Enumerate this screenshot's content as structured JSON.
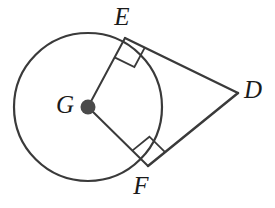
{
  "figure": {
    "type": "geometry-diagram",
    "background_color": "#ffffff",
    "stroke_color": "#3a3a3a",
    "label_color": "#1a1a1a",
    "circle": {
      "center_label": "G",
      "center_x": 88,
      "center_y": 107,
      "radius": 74,
      "stroke_width": 2.2
    },
    "points": [
      {
        "label": "E",
        "x": 125,
        "y": 38,
        "role": "tangent-point",
        "label_x": 122,
        "label_y": 19
      },
      {
        "label": "G",
        "x": 88,
        "y": 107,
        "role": "center",
        "label_x": 65,
        "label_y": 107
      },
      {
        "label": "D",
        "x": 238,
        "y": 93,
        "role": "external-point",
        "label_x": 253,
        "label_y": 92
      },
      {
        "label": "F",
        "x": 148,
        "y": 166,
        "role": "tangent-point",
        "label_x": 141,
        "label_y": 188
      }
    ],
    "segments": [
      {
        "name": "radius-GE",
        "from": "G",
        "to": "E",
        "x1": 88,
        "y1": 107,
        "x2": 125,
        "y2": 38,
        "stroke_width": 2.0
      },
      {
        "name": "radius-GF",
        "from": "G",
        "to": "F",
        "x1": 88,
        "y1": 107,
        "x2": 148,
        "y2": 166,
        "stroke_width": 2.0
      },
      {
        "name": "tangent-ED",
        "from": "E",
        "to": "D",
        "x1": 125,
        "y1": 38,
        "x2": 238,
        "y2": 93,
        "stroke_width": 2.4
      },
      {
        "name": "tangent-FD",
        "from": "F",
        "to": "D",
        "x1": 148,
        "y1": 166,
        "x2": 238,
        "y2": 93,
        "stroke_width": 2.4
      }
    ],
    "right_angle_marks": [
      {
        "name": "right-angle-at-E",
        "at_point": "E",
        "vertex_x": 125,
        "vertex_y": 38,
        "size": 22,
        "stroke_width": 1.8
      },
      {
        "name": "right-angle-at-F",
        "at_point": "F",
        "vertex_x": 148,
        "vertex_y": 166,
        "size": 22,
        "stroke_width": 1.8
      }
    ],
    "center_dot": {
      "x": 88,
      "y": 107,
      "radius": 7.5,
      "fill": "#4a4a4a"
    }
  }
}
